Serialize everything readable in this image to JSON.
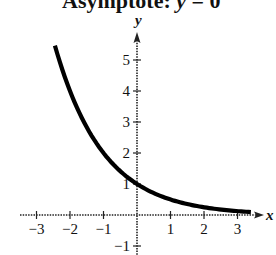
{
  "caption": {
    "prefix": "Asymptote: ",
    "var": "y",
    "suffix": " = 0"
  },
  "axes": {
    "x_label": "x",
    "y_label": "y"
  },
  "chart_data": {
    "type": "line",
    "title": "Asymptote: y = 0",
    "function": "y = (1/2)^x",
    "xlabel": "x",
    "ylabel": "y",
    "xlim": [
      -3.3,
      3.9
    ],
    "ylim": [
      -1.2,
      5.9
    ],
    "x_ticks": [
      -3,
      -2,
      -1,
      1,
      2,
      3
    ],
    "y_ticks": [
      -1,
      1,
      2,
      3,
      4,
      5
    ],
    "x_tick_labels": [
      "−3",
      "−2",
      "−1",
      "1",
      "2",
      "3"
    ],
    "y_tick_labels": [
      "−1",
      "1",
      "2",
      "3",
      "4",
      "5"
    ],
    "grid": false,
    "series": [
      {
        "name": "y = (1/2)^x",
        "x": [
          -2.45,
          -2,
          -1.5,
          -1,
          -0.5,
          0,
          0.5,
          1,
          1.5,
          2,
          2.5,
          3,
          3.4
        ],
        "y": [
          5.46,
          4.0,
          2.83,
          2.0,
          1.41,
          1.0,
          0.71,
          0.5,
          0.35,
          0.25,
          0.18,
          0.125,
          0.09
        ]
      }
    ],
    "asymptote": 0,
    "y_intercept": 1
  }
}
